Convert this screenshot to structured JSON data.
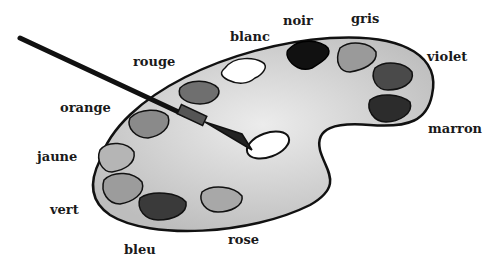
{
  "labels": {
    "blanc": "blanc",
    "noir": "noir",
    "gris": "gris",
    "rouge": "rouge",
    "violet": "violet",
    "orange": "orange",
    "marron": "marron",
    "jaune": "jaune",
    "vert": "vert",
    "bleu": "bleu",
    "rose": "rose"
  }
}
